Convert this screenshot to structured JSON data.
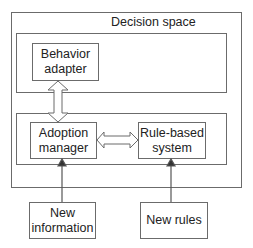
{
  "diagram": {
    "container_title": "Decision space",
    "nodes": {
      "behavior_adapter": "Behavior\nadapter",
      "adoption_manager": "Adoption\nmanager",
      "rule_based_system": "Rule-based\nsystem",
      "new_information": "New\ninformation",
      "new_rules": "New rules"
    },
    "edges": [
      {
        "from": "behavior_adapter",
        "to": "adoption_manager",
        "type": "bidirectional-hollow"
      },
      {
        "from": "adoption_manager",
        "to": "rule_based_system",
        "type": "bidirectional-hollow"
      },
      {
        "from": "new_information",
        "to": "adoption_manager",
        "type": "arrow"
      },
      {
        "from": "new_rules",
        "to": "rule_based_system",
        "type": "arrow"
      }
    ],
    "colors": {
      "stroke": "#6b6b6b",
      "text": "#222222",
      "background": "#ffffff"
    }
  }
}
